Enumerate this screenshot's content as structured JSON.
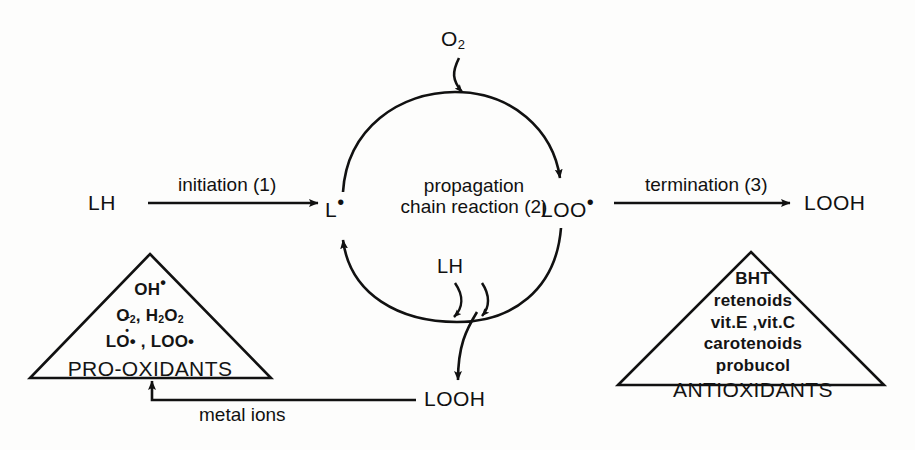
{
  "figure": {
    "kind": "lipid-peroxidation-chain-reaction-scheme",
    "background_color": "#fdfdfc",
    "ink_color": "#111111"
  },
  "species": {
    "substrate_left": "LH",
    "lipid_radical": "L",
    "peroxyl_radical": "LOO",
    "hydroperoxide_right": "LOOH",
    "hydroperoxide_bottom": "LOOH",
    "oxygen": "O",
    "oxygen_sub": "2",
    "substrate_cycle": "LH",
    "radical_dot": "•"
  },
  "steps": {
    "initiation": "initiation (1)",
    "propagation_line1": "propagation",
    "propagation_line2": "chain  reaction (2)",
    "termination": "termination (3)",
    "metal_ions": "metal ions"
  },
  "pro_oxidants": {
    "title": "PRO-OXIDANTS",
    "items": [
      {
        "formula": "OH",
        "dot": "•"
      },
      {
        "formula": "O2-, H2O2"
      },
      {
        "formula": "LO• , LOO•"
      }
    ],
    "line1_base": "OH",
    "line2_a": "O",
    "line2_a_sub": "2",
    "line2_a_charge": "–•",
    "line2_b": ", H",
    "line2_b_sub1": "2",
    "line2_b_o": "O",
    "line2_b_sub2": "2",
    "line3": "LO• , LOO•"
  },
  "antioxidants": {
    "title": "ANTIOXIDANTS",
    "items": [
      "BHT",
      "retenoids",
      "vit.E ,vit.C",
      "carotenoids",
      "probucol"
    ]
  }
}
